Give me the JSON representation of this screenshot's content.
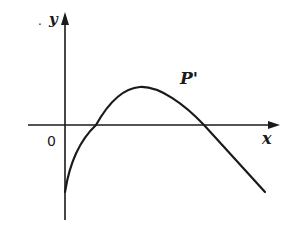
{
  "diagram": {
    "type": "function-graph",
    "axes": {
      "x_label": "x",
      "y_label": "y",
      "origin_label": "0",
      "y_label_prefix": "."
    },
    "curve": {
      "label": "P'",
      "description": "Downward-opening curve starting below origin on y-axis, crossing x-axis twice, peak above x-axis"
    },
    "colors": {
      "stroke": "#1a1a1a",
      "background": "#ffffff"
    }
  }
}
